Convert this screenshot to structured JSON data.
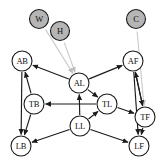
{
  "figure": {
    "type": "directed-causal-graph",
    "background_color": "#ffffff",
    "width": 162,
    "height": 166
  },
  "legend_colors": {
    "observed_node_fill": "#ffffff",
    "latent_node_fill": "#b5b5b5",
    "node_stroke": "#1a1a1a",
    "edge_black": "#1b1b1b",
    "edge_gray": "#c9c9c9"
  },
  "nodes": [
    {
      "id": "W",
      "label": "W",
      "x": 39,
      "y": 19,
      "r": 9.5,
      "fill": "latent"
    },
    {
      "id": "H",
      "label": "H",
      "x": 60,
      "y": 31,
      "r": 9.5,
      "fill": "latent"
    },
    {
      "id": "C",
      "label": "C",
      "x": 136,
      "y": 19,
      "r": 9.5,
      "fill": "latent"
    },
    {
      "id": "AB",
      "label": "AB",
      "x": 22,
      "y": 61,
      "r": 10,
      "fill": "observed"
    },
    {
      "id": "AF",
      "label": "AF",
      "x": 133,
      "y": 61,
      "r": 10,
      "fill": "observed"
    },
    {
      "id": "AL",
      "label": "AL",
      "x": 79,
      "y": 83,
      "r": 10,
      "fill": "observed"
    },
    {
      "id": "TB",
      "label": "TB",
      "x": 34,
      "y": 104,
      "r": 10,
      "fill": "observed"
    },
    {
      "id": "TL",
      "label": "TL",
      "x": 107,
      "y": 104,
      "r": 10,
      "fill": "observed"
    },
    {
      "id": "TF",
      "label": "TF",
      "x": 145,
      "y": 117,
      "r": 10,
      "fill": "observed"
    },
    {
      "id": "LL",
      "label": "LL",
      "x": 80,
      "y": 126,
      "r": 10,
      "fill": "observed"
    },
    {
      "id": "LB",
      "label": "LB",
      "x": 21,
      "y": 146,
      "r": 10,
      "fill": "observed"
    },
    {
      "id": "LF",
      "label": "LF",
      "x": 139,
      "y": 146,
      "r": 10,
      "fill": "observed"
    }
  ],
  "edges": [
    {
      "from": "W",
      "to": "AL",
      "style": "gray"
    },
    {
      "from": "H",
      "to": "AL",
      "style": "gray"
    },
    {
      "from": "C",
      "to": "TF",
      "style": "gray"
    },
    {
      "from": "AL",
      "to": "AB",
      "style": "black"
    },
    {
      "from": "AL",
      "to": "AF",
      "style": "black"
    },
    {
      "from": "AL",
      "to": "TL",
      "style": "black"
    },
    {
      "from": "TB",
      "to": "AB",
      "style": "black"
    },
    {
      "from": "AB",
      "to": "LB",
      "style": "black"
    },
    {
      "from": "TB",
      "to": "LB",
      "style": "black"
    },
    {
      "from": "TL",
      "to": "TB",
      "style": "black"
    },
    {
      "from": "LL",
      "to": "AL",
      "style": "black"
    },
    {
      "from": "LL",
      "to": "TL",
      "style": "black"
    },
    {
      "from": "LL",
      "to": "LB",
      "style": "black"
    },
    {
      "from": "LL",
      "to": "LF",
      "style": "black"
    },
    {
      "from": "TL",
      "to": "TF",
      "style": "black"
    },
    {
      "from": "TF",
      "to": "AF",
      "style": "black"
    },
    {
      "from": "AF",
      "to": "TF",
      "style": "black"
    },
    {
      "from": "AF",
      "to": "LF",
      "style": "black"
    },
    {
      "from": "TF",
      "to": "LF",
      "style": "black"
    }
  ]
}
